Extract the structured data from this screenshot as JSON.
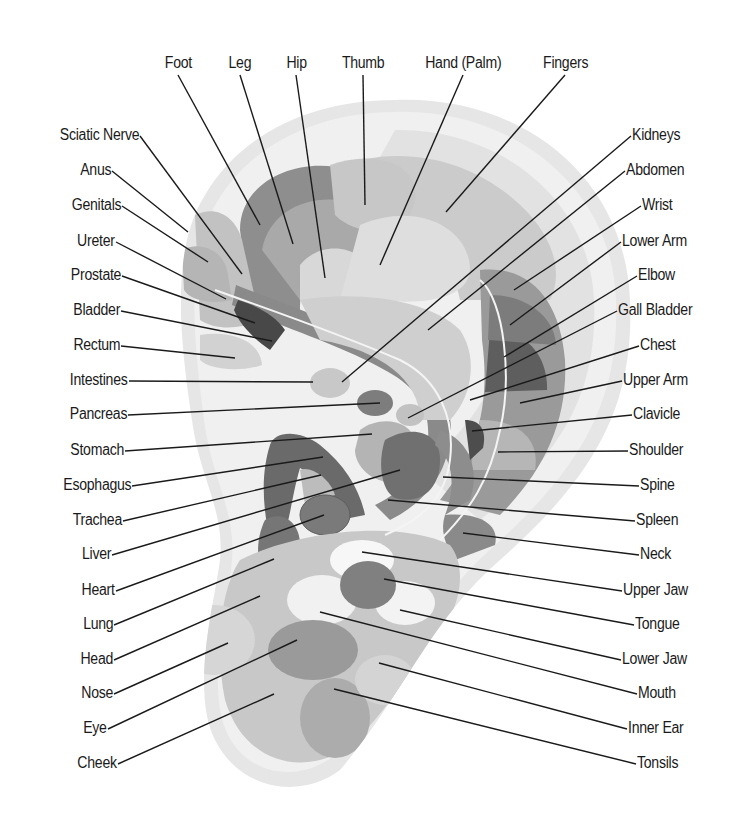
{
  "diagram": {
    "colors": {
      "outline": "#e4e4e4",
      "helix": "#efefef",
      "light": "#dcdcdc",
      "mid_light": "#c4c4c4",
      "mid": "#a9a9a9",
      "mid_dark": "#8c8c8c",
      "dark": "#6e6e6e",
      "darker": "#545454",
      "white_spot": "#f6f6f6",
      "line": "#1a1a1a"
    },
    "labels_top": [
      {
        "text": "Foot",
        "x": 178,
        "y": 63,
        "tx": 260,
        "ty": 225
      },
      {
        "text": "Leg",
        "x": 240,
        "y": 63,
        "tx": 293,
        "ty": 244
      },
      {
        "text": "Hip",
        "x": 296,
        "y": 63,
        "tx": 325,
        "ty": 278
      },
      {
        "text": "Thumb",
        "x": 363,
        "y": 63,
        "tx": 365,
        "ty": 205
      },
      {
        "text": "Hand (Palm)",
        "x": 463,
        "y": 63,
        "tx": 380,
        "ty": 265
      },
      {
        "text": "Fingers",
        "x": 565,
        "y": 63,
        "tx": 446,
        "ty": 212
      }
    ],
    "labels_left": [
      {
        "text": "Sciatic Nerve",
        "x": 139,
        "y": 135,
        "tx": 242,
        "ty": 274
      },
      {
        "text": "Anus",
        "x": 111,
        "y": 170,
        "tx": 188,
        "ty": 232
      },
      {
        "text": "Genitals",
        "x": 121,
        "y": 205,
        "tx": 208,
        "ty": 262
      },
      {
        "text": "Ureter",
        "x": 115,
        "y": 241,
        "tx": 226,
        "ty": 299
      },
      {
        "text": "Prostate",
        "x": 121,
        "y": 275,
        "tx": 255,
        "ty": 323
      },
      {
        "text": "Bladder",
        "x": 120,
        "y": 310,
        "tx": 272,
        "ty": 341
      },
      {
        "text": "Rectum",
        "x": 120,
        "y": 345,
        "tx": 235,
        "ty": 358
      },
      {
        "text": "Intestines",
        "x": 128,
        "y": 380,
        "tx": 313,
        "ty": 382
      },
      {
        "text": "Pancreas",
        "x": 127,
        "y": 414,
        "tx": 380,
        "ty": 403
      },
      {
        "text": "Stomach",
        "x": 124,
        "y": 450,
        "tx": 372,
        "ty": 434
      },
      {
        "text": "Esophagus",
        "x": 131,
        "y": 485,
        "tx": 323,
        "ty": 457
      },
      {
        "text": "Trachea",
        "x": 122,
        "y": 520,
        "tx": 321,
        "ty": 475
      },
      {
        "text": "Liver",
        "x": 111,
        "y": 554,
        "tx": 400,
        "ty": 470
      },
      {
        "text": "Heart",
        "x": 115,
        "y": 590,
        "tx": 324,
        "ty": 515
      },
      {
        "text": "Lung",
        "x": 113,
        "y": 624,
        "tx": 274,
        "ty": 559
      },
      {
        "text": "Head",
        "x": 113,
        "y": 659,
        "tx": 260,
        "ty": 596
      },
      {
        "text": "Nose",
        "x": 113,
        "y": 693,
        "tx": 228,
        "ty": 643
      },
      {
        "text": "Eye",
        "x": 107,
        "y": 728,
        "tx": 297,
        "ty": 640
      },
      {
        "text": "Cheek",
        "x": 117,
        "y": 763,
        "tx": 274,
        "ty": 694
      }
    ],
    "labels_right": [
      {
        "text": "Kidneys",
        "x": 632,
        "y": 135,
        "tx": 342,
        "ty": 382
      },
      {
        "text": "Abdomen",
        "x": 626,
        "y": 170,
        "tx": 428,
        "ty": 330
      },
      {
        "text": "Wrist",
        "x": 642,
        "y": 205,
        "tx": 514,
        "ty": 290
      },
      {
        "text": "Lower Arm",
        "x": 622,
        "y": 241,
        "tx": 510,
        "ty": 325
      },
      {
        "text": "Elbow",
        "x": 638,
        "y": 275,
        "tx": 504,
        "ty": 357
      },
      {
        "text": "Gall Bladder",
        "x": 618,
        "y": 310,
        "tx": 408,
        "ty": 418
      },
      {
        "text": "Chest",
        "x": 640,
        "y": 345,
        "tx": 470,
        "ty": 400
      },
      {
        "text": "Upper Arm",
        "x": 623,
        "y": 380,
        "tx": 520,
        "ty": 403
      },
      {
        "text": "Clavicle",
        "x": 633,
        "y": 414,
        "tx": 472,
        "ty": 431
      },
      {
        "text": "Shoulder",
        "x": 629,
        "y": 450,
        "tx": 498,
        "ty": 452
      },
      {
        "text": "Spine",
        "x": 640,
        "y": 485,
        "tx": 443,
        "ty": 477
      },
      {
        "text": "Spleen",
        "x": 636,
        "y": 520,
        "tx": 388,
        "ty": 500
      },
      {
        "text": "Neck",
        "x": 640,
        "y": 554,
        "tx": 463,
        "ty": 533
      },
      {
        "text": "Upper Jaw",
        "x": 623,
        "y": 590,
        "tx": 362,
        "ty": 552
      },
      {
        "text": "Tongue",
        "x": 635,
        "y": 624,
        "tx": 384,
        "ty": 579
      },
      {
        "text": "Lower Jaw",
        "x": 622,
        "y": 659,
        "tx": 400,
        "ty": 610
      },
      {
        "text": "Mouth",
        "x": 638,
        "y": 693,
        "tx": 320,
        "ty": 612
      },
      {
        "text": "Inner Ear",
        "x": 628,
        "y": 728,
        "tx": 379,
        "ty": 663
      },
      {
        "text": "Tonsils",
        "x": 637,
        "y": 763,
        "tx": 334,
        "ty": 689
      }
    ]
  }
}
